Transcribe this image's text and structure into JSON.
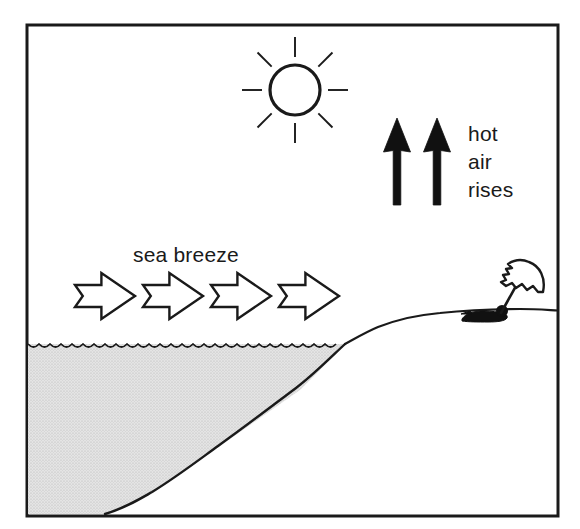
{
  "figure": {
    "type": "line-art illustration",
    "frame": {
      "x": 27,
      "y": 25,
      "width": 531,
      "height": 491,
      "stroke_color": "#1a1a1a",
      "stroke_width": 3,
      "fill_color": "#ffffff"
    }
  },
  "colors": {
    "ink": "#1a1a1a",
    "paper": "#ffffff",
    "water_fill": "#dcdcdc",
    "arrow_solid": "#111111",
    "arrow_outline_fill": "#ffffff"
  },
  "labels": {
    "sea_breeze": "sea breeze",
    "hot_air": [
      "hot",
      "air",
      "rises"
    ]
  },
  "elements": {
    "sun": {
      "name": "sun",
      "center_x": 295,
      "center_y": 90,
      "radius": 25,
      "ray_count": 8,
      "ray_inner": 33,
      "ray_outer": 53
    },
    "hot_air_arrows": {
      "name": "hot air rises arrows",
      "count": 2,
      "direction": "up",
      "style": "solid black",
      "positions": [
        397,
        437
      ],
      "top_y": 118,
      "bottom_y": 205
    },
    "breeze_arrows": {
      "name": "sea breeze arrows",
      "count": 4,
      "direction": "right",
      "style": "outlined hollow",
      "start_x": 75,
      "spacing": 68,
      "center_y": 296,
      "length": 60,
      "height": 46
    },
    "water": {
      "name": "sea water",
      "surface_y": 344,
      "wave_amplitude": 3,
      "wave_period": 11,
      "left_x": 28,
      "shore_x": 345
    },
    "seabed": {
      "name": "sea floor slope",
      "points": "105,514 150,495 200,460 250,425 300,390 320,370 345,344"
    },
    "beach": {
      "name": "beach shoreline",
      "points": "345,344 370,330 400,320 440,314 480,310 520,310 558,311"
    },
    "sunbather": {
      "name": "person lying on beach with umbrella",
      "body_x": 462,
      "body_y": 315,
      "head_x": 503,
      "head_y": 312,
      "umbrella_top_x": 523,
      "umbrella_top_y": 272,
      "umbrella_radius": 23
    }
  }
}
